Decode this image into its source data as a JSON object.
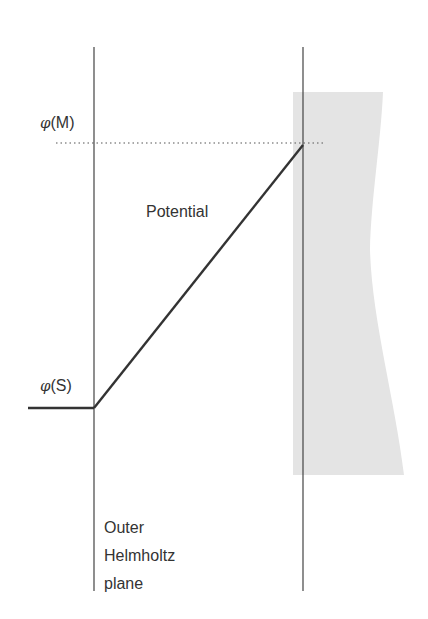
{
  "diagram": {
    "labels": {
      "phi_m_symbol": "φ",
      "phi_m_arg": "(M)",
      "phi_s_symbol": "φ",
      "phi_s_arg": "(S)",
      "potential": "Potential",
      "plane_line1": "Outer",
      "plane_line2": "Helmholtz",
      "plane_line3": "plane"
    },
    "colors": {
      "line": "#333333",
      "electrode_fill": "#e4e4e4",
      "dotted": "#555555",
      "background": "#ffffff"
    }
  }
}
